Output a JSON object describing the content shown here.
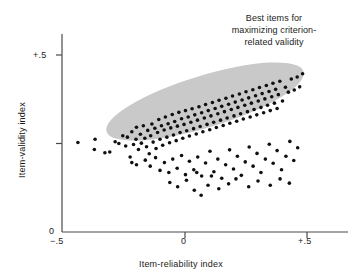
{
  "chart_data": {
    "type": "scatter",
    "title": "",
    "xlabel": "Item-reliability index",
    "ylabel": "Item-validity index",
    "xlim": [
      -0.5,
      0.58
    ],
    "ylim": [
      0.0,
      0.58
    ],
    "xticks": [
      -0.5,
      0.0,
      0.5
    ],
    "xtick_labels": [
      "−.5",
      "0",
      "+.5"
    ],
    "yticks": [
      0.0,
      0.25,
      0.5
    ],
    "ytick_labels": [
      "0",
      "",
      "+.5"
    ],
    "grid": false,
    "legend": "none",
    "marker": {
      "shape": "circle",
      "color": "#101010",
      "size_px": 3.6
    },
    "annotations": [
      {
        "name": "best-items-callout",
        "lines": [
          "Best items for",
          "maximizing criterion-",
          "related validity"
        ],
        "x": 0.33,
        "y": 0.55
      }
    ],
    "highlight_region": {
      "name": "best-items-ellipse",
      "shape": "ellipse",
      "fill": "#c9c9c9",
      "center": [
        0.34,
        0.0
      ],
      "center_x": 0.34,
      "center_y": 0.0,
      "cx_px": 205,
      "cy_px": 101.5,
      "rx_px": 103,
      "ry_px": 26,
      "rotation_deg": -17
    },
    "points": [
      [
        -0.435,
        0.253
      ],
      [
        -0.365,
        0.262
      ],
      [
        -0.368,
        0.233
      ],
      [
        -0.325,
        0.224
      ],
      [
        -0.305,
        0.226
      ],
      [
        -0.283,
        0.255
      ],
      [
        -0.268,
        0.25
      ],
      [
        -0.252,
        0.272
      ],
      [
        -0.24,
        0.243
      ],
      [
        -0.233,
        0.268
      ],
      [
        -0.222,
        0.212
      ],
      [
        -0.215,
        0.283
      ],
      [
        -0.208,
        0.247
      ],
      [
        -0.198,
        0.262
      ],
      [
        -0.196,
        0.296
      ],
      [
        -0.188,
        0.233
      ],
      [
        -0.18,
        0.276
      ],
      [
        -0.176,
        0.251
      ],
      [
        -0.168,
        0.3
      ],
      [
        -0.162,
        0.265
      ],
      [
        -0.155,
        0.241
      ],
      [
        -0.15,
        0.287
      ],
      [
        -0.144,
        0.221
      ],
      [
        -0.138,
        0.272
      ],
      [
        -0.133,
        0.305
      ],
      [
        -0.128,
        0.254
      ],
      [
        -0.121,
        0.293
      ],
      [
        -0.116,
        0.236
      ],
      [
        -0.11,
        0.281
      ],
      [
        -0.105,
        0.318
      ],
      [
        -0.1,
        0.262
      ],
      [
        -0.094,
        0.3
      ],
      [
        -0.089,
        0.245
      ],
      [
        -0.083,
        0.288
      ],
      [
        -0.078,
        0.325
      ],
      [
        -0.072,
        0.268
      ],
      [
        -0.067,
        0.306
      ],
      [
        -0.061,
        0.252
      ],
      [
        -0.056,
        0.294
      ],
      [
        -0.05,
        0.332
      ],
      [
        -0.045,
        0.274
      ],
      [
        -0.04,
        0.312
      ],
      [
        -0.034,
        0.258
      ],
      [
        -0.029,
        0.299
      ],
      [
        -0.023,
        0.338
      ],
      [
        -0.018,
        0.281
      ],
      [
        -0.012,
        0.32
      ],
      [
        -0.007,
        0.265
      ],
      [
        -0.002,
        0.304
      ],
      [
        0.004,
        0.343
      ],
      [
        0.009,
        0.286
      ],
      [
        0.015,
        0.325
      ],
      [
        0.02,
        0.271
      ],
      [
        0.026,
        0.31
      ],
      [
        0.031,
        0.348
      ],
      [
        0.037,
        0.292
      ],
      [
        0.042,
        0.331
      ],
      [
        0.048,
        0.277
      ],
      [
        0.053,
        0.316
      ],
      [
        0.059,
        0.354
      ],
      [
        0.064,
        0.298
      ],
      [
        0.07,
        0.337
      ],
      [
        0.075,
        0.283
      ],
      [
        0.081,
        0.322
      ],
      [
        0.086,
        0.36
      ],
      [
        0.092,
        0.304
      ],
      [
        0.097,
        0.343
      ],
      [
        0.103,
        0.289
      ],
      [
        0.108,
        0.328
      ],
      [
        0.114,
        0.366
      ],
      [
        0.119,
        0.31
      ],
      [
        0.125,
        0.349
      ],
      [
        0.13,
        0.295
      ],
      [
        0.136,
        0.334
      ],
      [
        0.141,
        0.372
      ],
      [
        0.147,
        0.316
      ],
      [
        0.152,
        0.355
      ],
      [
        0.158,
        0.301
      ],
      [
        0.163,
        0.34
      ],
      [
        0.169,
        0.378
      ],
      [
        0.174,
        0.322
      ],
      [
        0.18,
        0.361
      ],
      [
        0.185,
        0.307
      ],
      [
        0.191,
        0.346
      ],
      [
        0.196,
        0.384
      ],
      [
        0.202,
        0.328
      ],
      [
        0.207,
        0.367
      ],
      [
        0.213,
        0.313
      ],
      [
        0.218,
        0.352
      ],
      [
        0.224,
        0.39
      ],
      [
        0.229,
        0.334
      ],
      [
        0.235,
        0.373
      ],
      [
        0.24,
        0.319
      ],
      [
        0.246,
        0.358
      ],
      [
        0.251,
        0.396
      ],
      [
        0.257,
        0.34
      ],
      [
        0.262,
        0.379
      ],
      [
        0.268,
        0.325
      ],
      [
        0.273,
        0.364
      ],
      [
        0.279,
        0.402
      ],
      [
        0.284,
        0.346
      ],
      [
        0.29,
        0.385
      ],
      [
        0.295,
        0.331
      ],
      [
        0.301,
        0.37
      ],
      [
        0.306,
        0.408
      ],
      [
        0.312,
        0.352
      ],
      [
        0.317,
        0.391
      ],
      [
        0.323,
        0.337
      ],
      [
        0.328,
        0.376
      ],
      [
        0.334,
        0.414
      ],
      [
        0.339,
        0.358
      ],
      [
        0.345,
        0.397
      ],
      [
        0.35,
        0.343
      ],
      [
        0.356,
        0.382
      ],
      [
        0.361,
        0.42
      ],
      [
        0.367,
        0.364
      ],
      [
        0.372,
        0.403
      ],
      [
        0.378,
        0.349
      ],
      [
        0.383,
        0.388
      ],
      [
        0.389,
        0.426
      ],
      [
        0.4,
        0.37
      ],
      [
        0.412,
        0.409
      ],
      [
        0.424,
        0.395
      ],
      [
        0.436,
        0.432
      ],
      [
        0.448,
        0.401
      ],
      [
        0.46,
        0.438
      ],
      [
        0.47,
        0.41
      ],
      [
        0.482,
        0.447
      ],
      [
        -0.215,
        0.196
      ],
      [
        -0.196,
        0.19
      ],
      [
        -0.16,
        0.203
      ],
      [
        -0.14,
        0.186
      ],
      [
        -0.118,
        0.21
      ],
      [
        -0.1,
        0.174
      ],
      [
        -0.082,
        0.196
      ],
      [
        -0.064,
        0.168
      ],
      [
        -0.048,
        0.206
      ],
      [
        -0.03,
        0.18
      ],
      [
        -0.012,
        0.216
      ],
      [
        0.004,
        0.162
      ],
      [
        0.02,
        0.2
      ],
      [
        0.038,
        0.176
      ],
      [
        0.054,
        0.212
      ],
      [
        0.07,
        0.158
      ],
      [
        0.086,
        0.195
      ],
      [
        0.104,
        0.228
      ],
      [
        0.12,
        0.17
      ],
      [
        0.136,
        0.206
      ],
      [
        0.152,
        0.152
      ],
      [
        0.168,
        0.19
      ],
      [
        0.184,
        0.232
      ],
      [
        0.2,
        0.178
      ],
      [
        0.216,
        0.214
      ],
      [
        0.232,
        0.16
      ],
      [
        0.248,
        0.198
      ],
      [
        0.264,
        0.24
      ],
      [
        0.28,
        0.186
      ],
      [
        0.296,
        0.222
      ],
      [
        0.312,
        0.168
      ],
      [
        0.33,
        0.206
      ],
      [
        0.346,
        0.248
      ],
      [
        0.362,
        0.194
      ],
      [
        0.378,
        0.23
      ],
      [
        0.396,
        0.176
      ],
      [
        0.414,
        0.214
      ],
      [
        0.43,
        0.256
      ],
      [
        0.446,
        0.202
      ],
      [
        0.462,
        0.238
      ],
      [
        0.04,
        0.118
      ],
      [
        0.068,
        0.104
      ],
      [
        0.096,
        0.132
      ],
      [
        0.14,
        0.122
      ],
      [
        -0.06,
        0.14
      ],
      [
        -0.028,
        0.128
      ],
      [
        0.008,
        0.146
      ],
      [
        0.18,
        0.136
      ],
      [
        0.21,
        0.15
      ],
      [
        0.262,
        0.128
      ],
      [
        0.3,
        0.144
      ],
      [
        0.35,
        0.132
      ],
      [
        0.39,
        0.15
      ],
      [
        0.428,
        0.138
      ],
      [
        0.11,
        0.158
      ],
      [
        0.05,
        0.168
      ]
    ]
  },
  "axes": {
    "x_title": "Item-reliability index",
    "y_title": "Item-validity index",
    "x_ticks": [
      {
        "label": "−.5",
        "value": -0.5
      },
      {
        "label": "0",
        "value": 0
      },
      {
        "label": "+.5",
        "value": 0.5
      }
    ],
    "y_ticks": [
      {
        "label": "+.5",
        "value": 0.5
      },
      {
        "label": "",
        "value": 0.25
      },
      {
        "label": "0",
        "value": 0
      }
    ]
  },
  "callout": {
    "line1": "Best items for",
    "line2": "maximizing criterion-",
    "line3": "related validity"
  },
  "colors": {
    "axis": "#4a4a4a",
    "point": "#101010",
    "ellipse": "#c9c9c9",
    "text": "#1a1a1a",
    "background": "#ffffff"
  }
}
